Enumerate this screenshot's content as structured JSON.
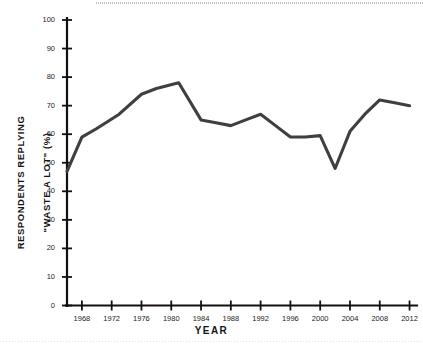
{
  "chart_data": {
    "type": "line",
    "title": "",
    "xlabel": "YEAR",
    "ylabel": "RESPONDENTS REPLYING \"WASTE A LOT\" (%)",
    "ylabel_line1": "RESPONDENTS REPLYING",
    "ylabel_line2": "\"WASTE A LOT\" (%)",
    "xlim": [
      1966,
      2013
    ],
    "ylim": [
      0,
      100
    ],
    "grid": false,
    "legend": null,
    "series_color": "#3f3f3f",
    "axis_color": "#111111",
    "x": [
      1966,
      1968,
      1970,
      1973,
      1976,
      1978,
      1981,
      1984,
      1986,
      1988,
      1990,
      1992,
      1994,
      1996,
      1998,
      2000,
      2002,
      2004,
      2006,
      2008,
      2010,
      2012
    ],
    "values": [
      47,
      59,
      62,
      67,
      74,
      76,
      78,
      65,
      64,
      63,
      65,
      67,
      63,
      59,
      59,
      59.5,
      48,
      61,
      67,
      72,
      71,
      70
    ],
    "series": [
      {
        "name": "Respondents replying \"waste a lot\"",
        "values": [
          47,
          59,
          62,
          67,
          74,
          76,
          78,
          65,
          64,
          63,
          65,
          67,
          63,
          59,
          59,
          59.5,
          48,
          61,
          67,
          72,
          71,
          70
        ]
      }
    ],
    "yticks": [
      0,
      10,
      20,
      30,
      40,
      50,
      60,
      70,
      80,
      90,
      100
    ],
    "ytick_labels": [
      "0",
      "10",
      "20",
      "30",
      "40",
      "50",
      "60",
      "70",
      "80",
      "90",
      "100"
    ],
    "xticks": [
      1968,
      1972,
      1976,
      1980,
      1984,
      1988,
      1992,
      1996,
      2000,
      2004,
      2008,
      2012
    ],
    "xtick_labels": [
      "1968",
      "1972",
      "1976",
      "1980",
      "1984",
      "1988",
      "1992",
      "1996",
      "2000",
      "2004",
      "2008",
      "2012"
    ]
  }
}
